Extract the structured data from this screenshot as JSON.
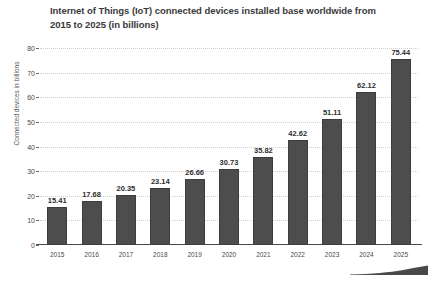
{
  "chart_data": {
    "type": "bar",
    "title": "Internet of Things (IoT) connected devices installed base worldwide from 2015 to 2025 (in billions)",
    "xlabel": "",
    "ylabel": "Connected devices in billions",
    "categories": [
      "2015",
      "2016",
      "2017",
      "2018",
      "2019",
      "2020",
      "2021",
      "2022",
      "2023",
      "2024",
      "2025"
    ],
    "values": [
      15.41,
      17.68,
      20.35,
      23.14,
      26.66,
      30.73,
      35.82,
      42.62,
      51.11,
      62.12,
      75.44
    ],
    "value_labels": [
      "15.41",
      "17.68",
      "20.35",
      "23.14",
      "26.66",
      "30.73",
      "35.82",
      "42.62",
      "51.11",
      "62.12",
      "75.44"
    ],
    "ylim": [
      0,
      80
    ],
    "ytick_values": [
      0,
      10,
      20,
      30,
      40,
      50,
      60,
      70,
      80
    ],
    "ytick_labels": [
      "0",
      "10",
      "20",
      "30",
      "40",
      "50",
      "60",
      "70",
      "80"
    ],
    "grid": true,
    "legend": null,
    "bar_color": "#4d4d4d",
    "bar_edge_color": "#3d3d3d",
    "grid_color": "#cfcfcf",
    "axis_color": "#4a4a4a",
    "title_color": "#3a3a3a",
    "background_color": "#ffffff"
  }
}
